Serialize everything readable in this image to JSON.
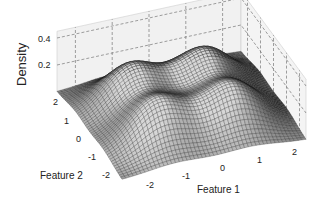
{
  "chart_data": {
    "type": "surface",
    "title": "",
    "xlabel": "Feature 1",
    "ylabel": "Feature 2",
    "zlabel": "Density",
    "x_ticks": [
      "-2",
      "-1",
      "0",
      "1",
      "2"
    ],
    "y_ticks": [
      "-2",
      "-1",
      "0",
      "1",
      "2"
    ],
    "z_ticks": [
      "0.2",
      "0.4"
    ],
    "xlim": [
      -2.5,
      2.5
    ],
    "ylim": [
      -2.5,
      2.5
    ],
    "zlim": [
      0,
      0.45
    ],
    "grid": true,
    "colormap": "gray",
    "components": [
      {
        "mu": [
          -1,
          -1
        ],
        "height": 0.3
      },
      {
        "mu": [
          1,
          -1
        ],
        "height": 0.3
      },
      {
        "mu": [
          -1,
          1
        ],
        "height": 0.3
      },
      {
        "mu": [
          1,
          1
        ],
        "height": 0.3
      }
    ],
    "sigma": 0.75
  }
}
